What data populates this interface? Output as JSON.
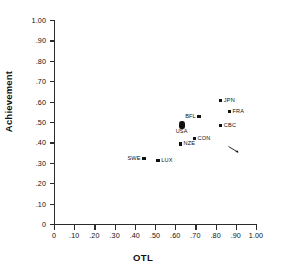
{
  "figure": {
    "background": "#ffffff",
    "marker_color": "#111111",
    "axis_color": "#2b2b2b"
  },
  "axes": {
    "x_title": "OTL",
    "y_title": "Achievement",
    "x_ticks": [
      "0",
      ".10",
      ".20",
      ".30",
      ".40",
      ".50",
      ".60",
      ".70",
      ".80",
      ".90",
      "1.00"
    ],
    "y_ticks": [
      "0",
      ".10",
      ".20",
      ".30",
      ".40",
      ".50",
      ".60",
      ".70",
      ".80",
      ".90",
      "1.00"
    ]
  },
  "chart_data": {
    "type": "scatter",
    "title": "",
    "xlabel": "OTL",
    "ylabel": "Achievement",
    "xlim": [
      0,
      1.0
    ],
    "ylim": [
      0,
      1.0
    ],
    "xticks": [
      0,
      0.1,
      0.2,
      0.3,
      0.4,
      0.5,
      0.6,
      0.7,
      0.8,
      0.9,
      1.0
    ],
    "yticks": [
      0,
      0.1,
      0.2,
      0.3,
      0.4,
      0.5,
      0.6,
      0.7,
      0.8,
      0.9,
      1.0
    ],
    "grid": false,
    "legend": "none",
    "points": [
      {
        "label": "SWE",
        "x": 0.445,
        "y": 0.322,
        "label_pos": "left",
        "marker": "square"
      },
      {
        "label": "LUX",
        "x": 0.515,
        "y": 0.312,
        "label_pos": "right",
        "marker": "square"
      },
      {
        "label": "NZE",
        "x": 0.625,
        "y": 0.393,
        "label_pos": "right",
        "marker": "square"
      },
      {
        "label": "USA",
        "x": 0.632,
        "y": 0.485,
        "label_pos": "below",
        "marker": "blob"
      },
      {
        "label": "CON",
        "x": 0.695,
        "y": 0.418,
        "label_pos": "right",
        "marker": "square"
      },
      {
        "label": "BFL",
        "x": 0.718,
        "y": 0.527,
        "label_pos": "left",
        "marker": "square"
      },
      {
        "label": "CBC",
        "x": 0.825,
        "y": 0.483,
        "label_pos": "right",
        "marker": "square"
      },
      {
        "label": "JPN",
        "x": 0.825,
        "y": 0.605,
        "label_pos": "right",
        "marker": "square"
      },
      {
        "label": "FRA",
        "x": 0.868,
        "y": 0.553,
        "label_pos": "right",
        "marker": "square"
      }
    ]
  }
}
